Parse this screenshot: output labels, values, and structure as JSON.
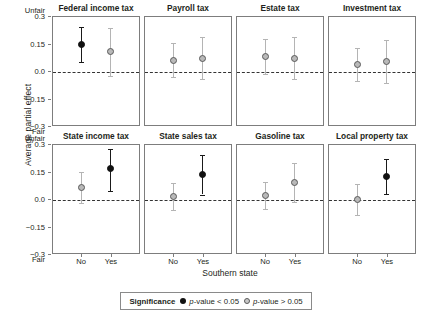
{
  "chart_data": {
    "type": "scatter",
    "title": "",
    "xlabel": "Southern state",
    "ylabel": "Average partial effect",
    "ylim": [
      -0.3,
      0.3
    ],
    "yticks": [
      0.3,
      0.15,
      0.0,
      -0.15,
      -0.3
    ],
    "ytick_labels": [
      "0.3",
      "0.15",
      "0.0",
      "−0.15",
      "−0.3"
    ],
    "y_high_label": "Unfair",
    "y_low_label": "Fair",
    "categories": [
      "No",
      "Yes"
    ],
    "grid": false,
    "zero_reference_line": 0.0,
    "legend": {
      "title": "Significance",
      "position": "bottom",
      "entries": [
        {
          "key": "sig",
          "label": "p-value < 0.05",
          "marker": "filled-circle",
          "color": "#111111"
        },
        {
          "key": "nsig",
          "label": "p-value > 0.05",
          "marker": "open-circle",
          "color": "#c9c9c9"
        }
      ]
    },
    "panels": [
      {
        "title": "Federal income tax",
        "points": [
          {
            "x": "No",
            "y": 0.15,
            "ci_low": 0.055,
            "ci_high": 0.245,
            "significance": "sig"
          },
          {
            "x": "Yes",
            "y": 0.11,
            "ci_low": -0.02,
            "ci_high": 0.24,
            "significance": "nsig"
          }
        ]
      },
      {
        "title": "Payroll tax",
        "points": [
          {
            "x": "No",
            "y": 0.065,
            "ci_low": -0.025,
            "ci_high": 0.16,
            "significance": "nsig"
          },
          {
            "x": "Yes",
            "y": 0.075,
            "ci_low": -0.04,
            "ci_high": 0.19,
            "significance": "nsig"
          }
        ]
      },
      {
        "title": "Estate tax",
        "points": [
          {
            "x": "No",
            "y": 0.085,
            "ci_low": -0.01,
            "ci_high": 0.18,
            "significance": "nsig"
          },
          {
            "x": "Yes",
            "y": 0.075,
            "ci_low": -0.04,
            "ci_high": 0.19,
            "significance": "nsig"
          }
        ]
      },
      {
        "title": "Investment tax",
        "points": [
          {
            "x": "No",
            "y": 0.04,
            "ci_low": -0.05,
            "ci_high": 0.13,
            "significance": "nsig"
          },
          {
            "x": "Yes",
            "y": 0.055,
            "ci_low": -0.06,
            "ci_high": 0.175,
            "significance": "nsig"
          }
        ]
      },
      {
        "title": "State income tax",
        "points": [
          {
            "x": "No",
            "y": 0.07,
            "ci_low": -0.015,
            "ci_high": 0.155,
            "significance": "nsig"
          },
          {
            "x": "Yes",
            "y": 0.17,
            "ci_low": 0.05,
            "ci_high": 0.28,
            "significance": "sig"
          }
        ]
      },
      {
        "title": "State sales tax",
        "points": [
          {
            "x": "No",
            "y": 0.02,
            "ci_low": -0.055,
            "ci_high": 0.095,
            "significance": "nsig"
          },
          {
            "x": "Yes",
            "y": 0.14,
            "ci_low": 0.03,
            "ci_high": 0.245,
            "significance": "sig"
          }
        ]
      },
      {
        "title": "Gasoline tax",
        "points": [
          {
            "x": "No",
            "y": 0.025,
            "ci_low": -0.05,
            "ci_high": 0.1,
            "significance": "nsig"
          },
          {
            "x": "Yes",
            "y": 0.095,
            "ci_low": -0.01,
            "ci_high": 0.2,
            "significance": "nsig"
          }
        ]
      },
      {
        "title": "Local property tax",
        "points": [
          {
            "x": "No",
            "y": 0.005,
            "ci_low": -0.08,
            "ci_high": 0.09,
            "significance": "nsig"
          },
          {
            "x": "Yes",
            "y": 0.13,
            "ci_low": 0.035,
            "ci_high": 0.225,
            "significance": "sig"
          }
        ]
      }
    ]
  }
}
